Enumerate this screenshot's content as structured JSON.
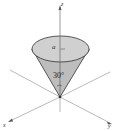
{
  "diagram": {
    "type": "3d-cone",
    "axes": {
      "z_label": "z",
      "x_label": "x",
      "y_label": "y"
    },
    "radius_label": "a",
    "angle_label": "30°",
    "colors": {
      "cone_fill": "#bdbdbd",
      "top_fill": "#cfcfcf",
      "axis": "#777777",
      "outline": "#333333"
    }
  }
}
